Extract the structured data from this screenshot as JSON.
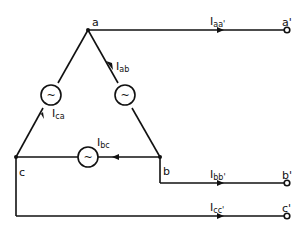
{
  "nodes": {
    "a": "a",
    "b": "b",
    "c": "c",
    "a_out": "a'",
    "b_out": "b'",
    "c_out": "c'"
  },
  "currents": {
    "ab": {
      "main": "I",
      "sub": "ab"
    },
    "bc": {
      "main": "I",
      "sub": "bc"
    },
    "ca": {
      "main": "I",
      "sub": "ca"
    },
    "aa": {
      "main": "I",
      "sub": "aa'"
    },
    "bb": {
      "main": "I",
      "sub": "bb'"
    },
    "cc": {
      "main": "I",
      "sub": "cc'"
    }
  },
  "source_symbol": "~",
  "colors": {
    "line": "#111111",
    "background": "#ffffff"
  }
}
